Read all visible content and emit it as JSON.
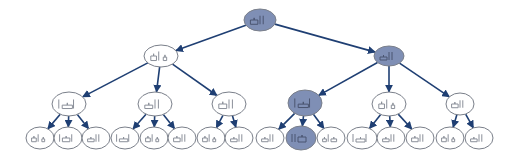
{
  "diagram": {
    "type": "tree",
    "title": "",
    "colors": {
      "edge": "#1f3f73",
      "node_stroke": "#7a7f8a",
      "node_fill": "#ffffff",
      "highlight_fill": "#7f8fb5",
      "glyph": "#8a8f99",
      "glyph_highlight": "#4a5470"
    },
    "nodes": [
      {
        "id": "root",
        "x": 260,
        "y": 20,
        "rx": 16,
        "ry": 11,
        "highlighted": true,
        "glyph": "bar-chart-icon-a"
      },
      {
        "id": "L1-0",
        "x": 161,
        "y": 56,
        "rx": 17,
        "ry": 11,
        "highlighted": false,
        "glyph": "bar-chart-icon-b"
      },
      {
        "id": "L1-1",
        "x": 389,
        "y": 56,
        "rx": 15,
        "ry": 10,
        "highlighted": true,
        "glyph": "bar-chart-icon-c"
      },
      {
        "id": "L2-0",
        "x": 69,
        "y": 104,
        "rx": 17,
        "ry": 12,
        "highlighted": false,
        "glyph": "bar-chart-icon-d"
      },
      {
        "id": "L2-1",
        "x": 155,
        "y": 104,
        "rx": 17,
        "ry": 12,
        "highlighted": false,
        "glyph": "bar-chart-icon-c"
      },
      {
        "id": "L2-2",
        "x": 229,
        "y": 104,
        "rx": 17,
        "ry": 12,
        "highlighted": false,
        "glyph": "bar-chart-icon-a"
      },
      {
        "id": "L2-3",
        "x": 305,
        "y": 103,
        "rx": 17,
        "ry": 13,
        "highlighted": true,
        "glyph": "bar-chart-icon-d"
      },
      {
        "id": "L2-4",
        "x": 389,
        "y": 104,
        "rx": 17,
        "ry": 12,
        "highlighted": false,
        "glyph": "bar-chart-icon-b"
      },
      {
        "id": "L2-5",
        "x": 460,
        "y": 104,
        "rx": 14,
        "ry": 11,
        "highlighted": false,
        "glyph": "bar-chart-icon-a"
      },
      {
        "id": "L3-0",
        "x": 40,
        "y": 138,
        "rx": 14,
        "ry": 11,
        "highlighted": false,
        "glyph": "bar-chart-icon-b"
      },
      {
        "id": "L3-1",
        "x": 68,
        "y": 138,
        "rx": 14,
        "ry": 11,
        "highlighted": false,
        "glyph": "bar-chart-icon-e"
      },
      {
        "id": "L3-2",
        "x": 96,
        "y": 138,
        "rx": 14,
        "ry": 11,
        "highlighted": false,
        "glyph": "bar-chart-icon-c"
      },
      {
        "id": "L3-3",
        "x": 125,
        "y": 138,
        "rx": 14,
        "ry": 11,
        "highlighted": false,
        "glyph": "bar-chart-icon-d"
      },
      {
        "id": "L3-4",
        "x": 154,
        "y": 138,
        "rx": 14,
        "ry": 11,
        "highlighted": false,
        "glyph": "bar-chart-icon-b"
      },
      {
        "id": "L3-5",
        "x": 182,
        "y": 138,
        "rx": 14,
        "ry": 11,
        "highlighted": false,
        "glyph": "bar-chart-icon-a"
      },
      {
        "id": "L3-6",
        "x": 211,
        "y": 138,
        "rx": 14,
        "ry": 11,
        "highlighted": false,
        "glyph": "bar-chart-icon-b"
      },
      {
        "id": "L3-7",
        "x": 239,
        "y": 138,
        "rx": 14,
        "ry": 11,
        "highlighted": false,
        "glyph": "bar-chart-icon-c"
      },
      {
        "id": "L3-8",
        "x": 270,
        "y": 138,
        "rx": 14,
        "ry": 11,
        "highlighted": false,
        "glyph": "bar-chart-icon-c"
      },
      {
        "id": "L3-9",
        "x": 301,
        "y": 138,
        "rx": 15,
        "ry": 12,
        "highlighted": true,
        "glyph": "bar-chart-icon-f"
      },
      {
        "id": "L3-10",
        "x": 331,
        "y": 138,
        "rx": 14,
        "ry": 11,
        "highlighted": false,
        "glyph": "bar-chart-icon-g"
      },
      {
        "id": "L3-11",
        "x": 362,
        "y": 138,
        "rx": 15,
        "ry": 11,
        "highlighted": false,
        "glyph": "bar-chart-icon-d"
      },
      {
        "id": "L3-12",
        "x": 391,
        "y": 138,
        "rx": 14,
        "ry": 11,
        "highlighted": false,
        "glyph": "bar-chart-icon-c"
      },
      {
        "id": "L3-13",
        "x": 420,
        "y": 138,
        "rx": 14,
        "ry": 11,
        "highlighted": false,
        "glyph": "bar-chart-icon-a"
      },
      {
        "id": "L3-14",
        "x": 450,
        "y": 138,
        "rx": 14,
        "ry": 11,
        "highlighted": false,
        "glyph": "bar-chart-icon-b"
      },
      {
        "id": "L3-15",
        "x": 479,
        "y": 138,
        "rx": 14,
        "ry": 11,
        "highlighted": false,
        "glyph": "bar-chart-icon-c"
      }
    ],
    "edges": [
      [
        "root",
        "L1-0"
      ],
      [
        "root",
        "L1-1"
      ],
      [
        "L1-0",
        "L2-0"
      ],
      [
        "L1-0",
        "L2-1"
      ],
      [
        "L1-0",
        "L2-2"
      ],
      [
        "L1-1",
        "L2-3"
      ],
      [
        "L1-1",
        "L2-4"
      ],
      [
        "L1-1",
        "L2-5"
      ],
      [
        "L2-0",
        "L3-0"
      ],
      [
        "L2-0",
        "L3-1"
      ],
      [
        "L2-0",
        "L3-2"
      ],
      [
        "L2-1",
        "L3-3"
      ],
      [
        "L2-1",
        "L3-4"
      ],
      [
        "L2-1",
        "L3-5"
      ],
      [
        "L2-2",
        "L3-6"
      ],
      [
        "L2-2",
        "L3-7"
      ],
      [
        "L2-3",
        "L3-8"
      ],
      [
        "L2-3",
        "L3-9"
      ],
      [
        "L2-3",
        "L3-10"
      ],
      [
        "L2-4",
        "L3-11"
      ],
      [
        "L2-4",
        "L3-12"
      ],
      [
        "L2-4",
        "L3-13"
      ],
      [
        "L2-5",
        "L3-14"
      ],
      [
        "L2-5",
        "L3-15"
      ]
    ]
  }
}
